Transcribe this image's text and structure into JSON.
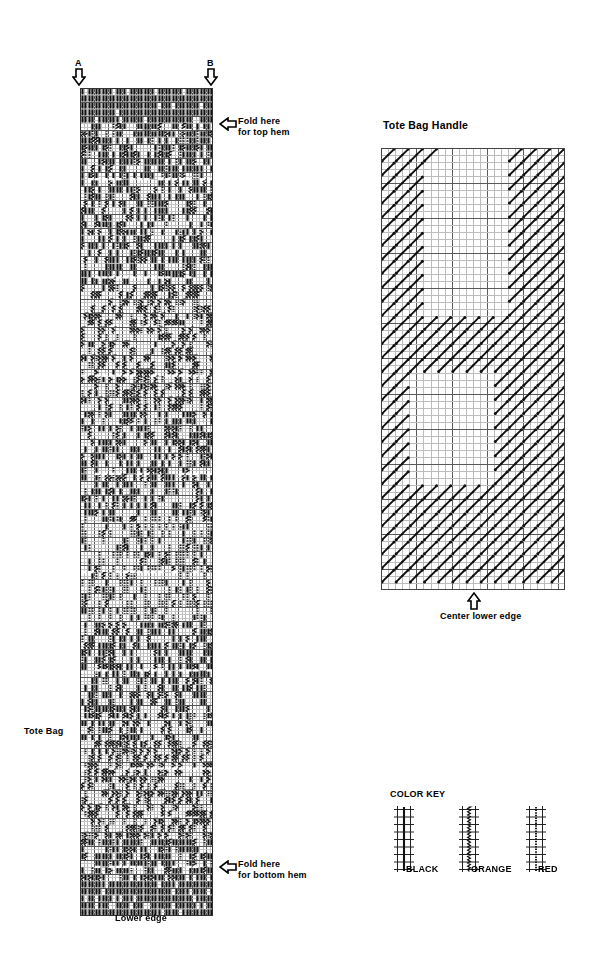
{
  "labels": {
    "marker_a": "A",
    "marker_b": "B",
    "fold_top": "Fold here\nfor top hem",
    "fold_bottom": "Fold here\nfor bottom hem",
    "lower_edge": "Lower edge",
    "tote_bag": "Tote Bag",
    "handle_title": "Tote Bag Handle",
    "center_lower_edge": "Center lower edge",
    "color_key_title": "COLOR KEY"
  },
  "color_key": {
    "items": [
      {
        "name": "BLACK",
        "symbol": "solid-vertical-line",
        "hex": "#000000"
      },
      {
        "name": "ORANGE",
        "symbol": "wavy-vertical-line",
        "hex": "#000000"
      },
      {
        "name": "RED",
        "symbol": "dotted-vertical-line",
        "hex": "#000000"
      }
    ]
  },
  "chart_data": {
    "type": "heatmap",
    "xlabel": "",
    "ylabel": "",
    "legend_position": "bottom-right",
    "grid": true,
    "charts": [
      {
        "name": "Tote Bag",
        "cols": 38,
        "rows": 236,
        "cell_w": 3.5,
        "cell_h": 3.5,
        "symbols": {
          "1": "BLACK",
          "2": "ORANGE",
          "3": "RED"
        },
        "notes": "Vertical surface-weaving stitches; each mark spans 2 grid rows. Pattern is a dense mirrored diamond/zigzag motif repeating down the bag panel, densest black at top and bottom hem bands.",
        "bands": [
          {
            "from_row": 0,
            "to_row": 26,
            "dominant": "BLACK",
            "density": 0.8
          },
          {
            "from_row": 26,
            "to_row": 56,
            "dominant": "BLACK",
            "density": 0.66
          },
          {
            "from_row": 56,
            "to_row": 92,
            "dominant": "ORANGE",
            "density": 0.58
          },
          {
            "from_row": 92,
            "to_row": 122,
            "dominant": "BLACK",
            "density": 0.62
          },
          {
            "from_row": 122,
            "to_row": 152,
            "dominant": "RED",
            "density": 0.55
          },
          {
            "from_row": 152,
            "to_row": 186,
            "dominant": "BLACK",
            "density": 0.64
          },
          {
            "from_row": 186,
            "to_row": 214,
            "dominant": "ORANGE",
            "density": 0.6
          },
          {
            "from_row": 214,
            "to_row": 236,
            "dominant": "BLACK",
            "density": 0.82
          }
        ],
        "fold_top_row": 12,
        "fold_bottom_row": 222,
        "marker_a_col": 1,
        "marker_b_col": 36
      },
      {
        "name": "Tote Bag Handle",
        "cols": 26,
        "rows": 63,
        "cell_w": 7,
        "cell_h": 7,
        "symbols": {
          "4": "DIAGONAL"
        },
        "notes": "Diagonal stitches each spanning 2 cells right and 2 cells up, filling a border frame; two blank rectangular openings in the interior.",
        "blank_regions": [
          {
            "col_from": 7,
            "col_to": 18,
            "row_from": 2,
            "row_to": 24
          },
          {
            "col_from": 4,
            "col_to": 16,
            "row_from": 33,
            "row_to": 47
          }
        ]
      }
    ]
  }
}
